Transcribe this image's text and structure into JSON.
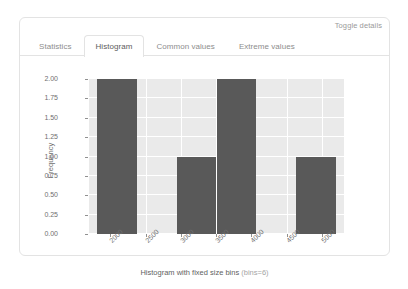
{
  "panel": {
    "toggle_details_label": "Toggle details",
    "tabs": [
      {
        "label": "Statistics",
        "active": false
      },
      {
        "label": "Histogram",
        "active": true
      },
      {
        "label": "Common values",
        "active": false
      },
      {
        "label": "Extreme values",
        "active": false
      }
    ]
  },
  "chart_data": {
    "type": "bar",
    "title": "Histogram with fixed size bins (bins=6)",
    "title_main": "Histogram with fixed size bins",
    "title_sub": "(bins=6)",
    "xlabel": "",
    "ylabel": "Frequency",
    "bins": 6,
    "bin_edges": [
      1810,
      2375,
      2940,
      3505,
      4070,
      4635,
      5200
    ],
    "categories": [
      "1810-2375",
      "2375-2940",
      "2940-3505",
      "3505-4070",
      "4070-4635",
      "4635-5200"
    ],
    "values": [
      2,
      0,
      1,
      2,
      0,
      1
    ],
    "xlim": [
      1700,
      5310
    ],
    "ylim": [
      0,
      2.0
    ],
    "xticks": [
      2000,
      2500,
      3000,
      3500,
      4000,
      4500,
      5000
    ],
    "xtick_labels": [
      "2000",
      "2500",
      "3000",
      "3500",
      "4000",
      "4500",
      "5000"
    ],
    "yticks": [
      0.0,
      0.25,
      0.5,
      0.75,
      1.0,
      1.25,
      1.5,
      1.75,
      2.0
    ],
    "ytick_labels": [
      "0.00",
      "0.25",
      "0.50",
      "0.75",
      "1.00",
      "1.25",
      "1.50",
      "1.75",
      "2.00"
    ],
    "grid": true,
    "legend": false,
    "bar_color": "#595959",
    "plot_bg": "#eaeaea",
    "grid_color": "#ffffff"
  }
}
